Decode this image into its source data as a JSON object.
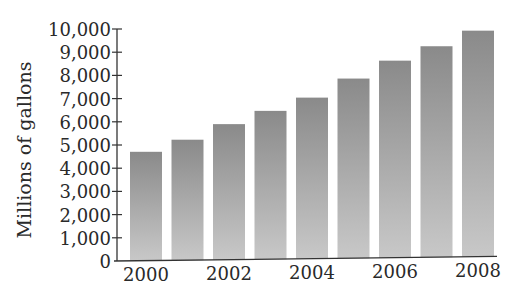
{
  "chart_data": {
    "type": "bar",
    "title": "",
    "xlabel": "",
    "ylabel": "Millions of gallons",
    "categories": [
      "2000",
      "2001",
      "2002",
      "2003",
      "2004",
      "2005",
      "2006",
      "2007",
      "2008"
    ],
    "values": [
      4700,
      5200,
      5850,
      6400,
      6950,
      7750,
      8500,
      9100,
      9750
    ],
    "x_tick_labels": [
      "2000",
      "2002",
      "2004",
      "2006",
      "2008"
    ],
    "y_tick_labels": [
      "0",
      "1,000",
      "2,000",
      "3,000",
      "4,000",
      "5,000",
      "6,000",
      "7,000",
      "8,000",
      "9,000",
      "10,000"
    ],
    "ylim": [
      0,
      10000
    ],
    "grid": false,
    "legend": null,
    "bar_color_top": "#8a8a8a",
    "bar_color_bottom": "#c8c8c8"
  }
}
